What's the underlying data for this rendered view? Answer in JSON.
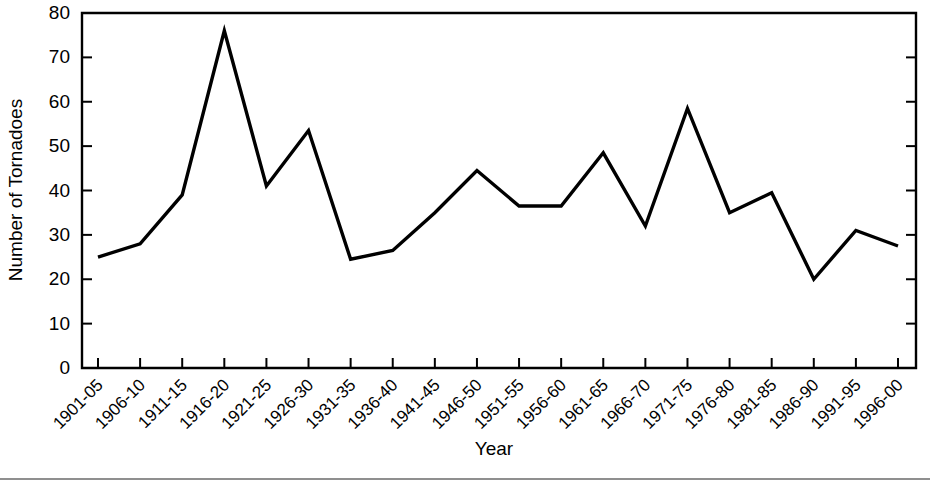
{
  "chart_data": {
    "type": "line",
    "title": "",
    "xlabel": "Year",
    "ylabel": "Number of Tornadoes",
    "categories": [
      "1901-05",
      "1906-10",
      "1911-15",
      "1916-20",
      "1921-25",
      "1926-30",
      "1931-35",
      "1936-40",
      "1941-45",
      "1946-50",
      "1951-55",
      "1956-60",
      "1961-65",
      "1966-70",
      "1971-75",
      "1976-80",
      "1981-85",
      "1986-90",
      "1991-95",
      "1996-00"
    ],
    "values": [
      25,
      28,
      39,
      76,
      41,
      53.5,
      24.5,
      26.5,
      35,
      44.5,
      36.5,
      36.5,
      48.5,
      32,
      58.5,
      35,
      39.5,
      20,
      31,
      27.5
    ],
    "ylim": [
      0,
      80
    ],
    "yticks": [
      0,
      10,
      20,
      30,
      40,
      50,
      60,
      70,
      80
    ],
    "ytick_labels": [
      "0",
      "10",
      "20",
      "30",
      "40",
      "50",
      "60",
      "70",
      "80"
    ],
    "grid": false,
    "legend": null,
    "series_color": "#000000",
    "line_width": 3.4,
    "frame": "box",
    "xtick_rotation": -45
  },
  "axes": {
    "y_axis_title": "Number of Tornadoes",
    "x_axis_title": "Year"
  },
  "figure": {
    "background_color": "#ffffff",
    "foreground_color": "#000000"
  }
}
